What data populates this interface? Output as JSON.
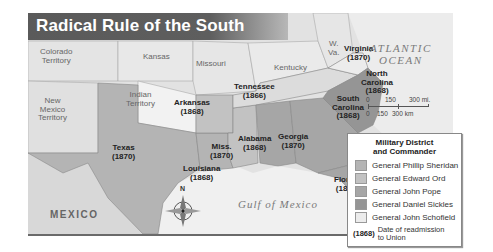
{
  "title": "Radical Rule of the South",
  "labels": {
    "colorado": "Colorado\nTerritory",
    "kansas": "Kansas",
    "missouri": "Missouri",
    "kentucky": "Kentucky",
    "wva": "W.\nVa.",
    "virginia": "Virginia\n(1870)",
    "new_mexico": "New\nMexico\nTerritory",
    "indian": "Indian\nTerritory",
    "arkansas": "Arkansas\n(1868)",
    "tennessee": "Tennessee\n(1866)",
    "north_carolina": "North\nCarolina\n(1868)",
    "south_carolina": "South\nCarolina\n(1868)",
    "texas": "Texas\n(1870)",
    "mississippi": "Miss.\n(1870)",
    "alabama": "Alabama\n(1868)",
    "georgia": "Georgia\n(1870)",
    "louisiana": "Louisiana\n(1868)",
    "florida": "Florida\n(1868)",
    "mexico": "MEXICO",
    "gulf": "Gulf of Mexico",
    "atlantic": "ATLANTIC\nOCEAN",
    "compass_n": "N"
  },
  "scale": {
    "mi": [
      "0",
      "150",
      "300 mi."
    ],
    "km": [
      "0",
      "150",
      "300 km"
    ]
  },
  "legend": {
    "title": "Military District\nand Commander",
    "items": [
      {
        "label": "General Phillip Sheridan",
        "color": "#b4b4b4"
      },
      {
        "label": "General Edward Ord",
        "color": "#c2c2c2"
      },
      {
        "label": "General John Pope",
        "color": "#a6a6a6"
      },
      {
        "label": "General Daniel Sickles",
        "color": "#959595"
      },
      {
        "label": "General John Schofield",
        "color": "#ececec"
      }
    ],
    "note_key": "(1868)",
    "note_text": "Date of readmission\nto Union"
  }
}
